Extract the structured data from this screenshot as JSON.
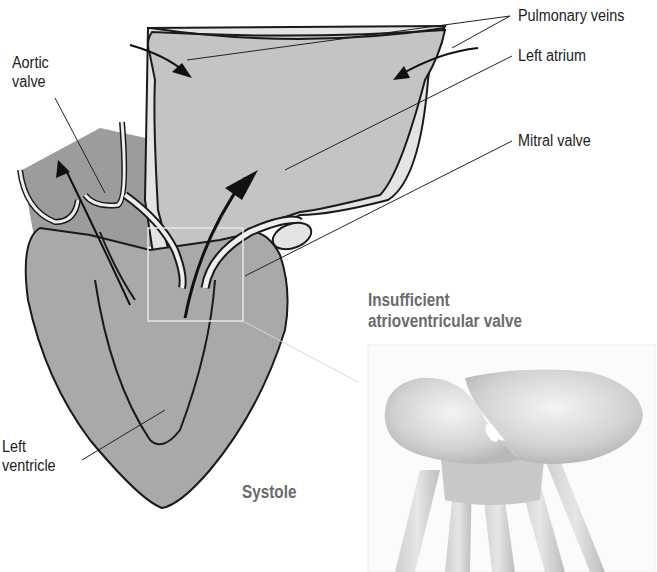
{
  "figure": {
    "phase_label": "Systole",
    "labels": {
      "aortic_valve_line1": "Aortic",
      "aortic_valve_line2": "valve",
      "pulmonary_veins": "Pulmonary veins",
      "left_atrium": "Left atrium",
      "mitral_valve": "Mitral valve",
      "left_ventricle_line1": "Left",
      "left_ventricle_line2": "ventricle"
    },
    "inset": {
      "title_line1": "Insufficient",
      "title_line2": "atrioventricular valve"
    },
    "colors": {
      "ventricle_fill": "#a9a9a9",
      "atrium_fill": "#c4c4c4",
      "vessel_fill": "#e4e4e4",
      "aorta_fill": "#9c9c9c",
      "outline": "#1a1a1a",
      "caption_gray": "#6b6b6b"
    }
  }
}
